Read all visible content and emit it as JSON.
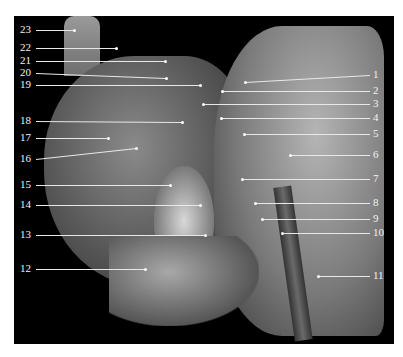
{
  "figure": {
    "type": "anatomical dissection photograph (grayscale), lateral view of head and neck with numbered leader labels",
    "labels_left": [
      {
        "n": "23",
        "y": 30,
        "tx": 74,
        "ty": 30
      },
      {
        "n": "22",
        "y": 48,
        "tx": 116,
        "ty": 48
      },
      {
        "n": "21",
        "y": 61,
        "tx": 165,
        "ty": 61
      },
      {
        "n": "20",
        "y": 73,
        "tx": 166,
        "ty": 78
      },
      {
        "n": "19",
        "y": 85,
        "tx": 200,
        "ty": 85
      },
      {
        "n": "18",
        "y": 121,
        "tx": 182,
        "ty": 122
      },
      {
        "n": "17",
        "y": 138,
        "tx": 108,
        "ty": 138
      },
      {
        "n": "16",
        "y": 159,
        "tx": 136,
        "ty": 148
      },
      {
        "n": "15",
        "y": 185,
        "tx": 170,
        "ty": 185
      },
      {
        "n": "14",
        "y": 205,
        "tx": 200,
        "ty": 205
      },
      {
        "n": "13",
        "y": 235,
        "tx": 205,
        "ty": 235
      },
      {
        "n": "12",
        "y": 269,
        "tx": 145,
        "ty": 269
      }
    ],
    "labels_right": [
      {
        "n": "1",
        "y": 75,
        "tx": 245,
        "ty": 82
      },
      {
        "n": "2",
        "y": 91,
        "tx": 222,
        "ty": 91
      },
      {
        "n": "3",
        "y": 104,
        "tx": 203,
        "ty": 104
      },
      {
        "n": "4",
        "y": 118,
        "tx": 221,
        "ty": 118
      },
      {
        "n": "5",
        "y": 134,
        "tx": 244,
        "ty": 134
      },
      {
        "n": "6",
        "y": 155,
        "tx": 290,
        "ty": 155
      },
      {
        "n": "7",
        "y": 179,
        "tx": 242,
        "ty": 179
      },
      {
        "n": "8",
        "y": 203,
        "tx": 255,
        "ty": 203
      },
      {
        "n": "9",
        "y": 219,
        "tx": 262,
        "ty": 219
      },
      {
        "n": "10",
        "y": 233,
        "tx": 282,
        "ty": 233
      },
      {
        "n": "11",
        "y": 276,
        "tx": 318,
        "ty": 276
      }
    ],
    "colors": {
      "background": "#000000",
      "page": "#ffffff",
      "label": "#f2f2f2"
    }
  }
}
